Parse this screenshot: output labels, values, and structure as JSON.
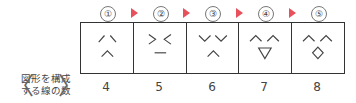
{
  "steps": [
    {
      "marker": "①",
      "count": "4",
      "figure": "two diagonals + caret"
    },
    {
      "marker": "②",
      "count": "5",
      "figure": "> < with underline"
    },
    {
      "marker": "③",
      "count": "6",
      "figure": "two V shapes + caret"
    },
    {
      "marker": "④",
      "count": "7",
      "figure": "two carets + triangle"
    },
    {
      "marker": "⑤",
      "count": "8",
      "figure": "two carets + diamond"
    }
  ],
  "row_label": {
    "line1": "図形を構成",
    "line2": "する線の数",
    "bracket_left": "〈",
    "bracket_right": "〉"
  },
  "colors": {
    "arrow": "#e8505b",
    "line": "#333333"
  }
}
